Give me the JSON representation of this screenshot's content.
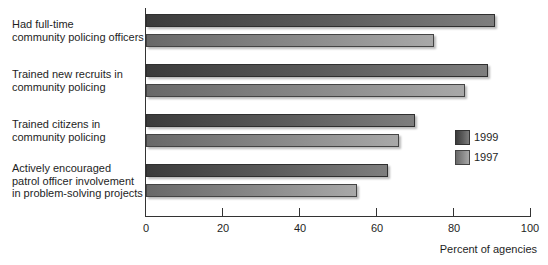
{
  "chart_data": {
    "type": "bar",
    "orientation": "horizontal",
    "title": "",
    "xlabel": "Percent of agencies",
    "ylabel": "",
    "xlim": [
      0,
      100
    ],
    "x_ticks": [
      "0",
      "20",
      "40",
      "60",
      "80",
      "100"
    ],
    "grid": false,
    "legend_position": "right",
    "categories": [
      "Had full-time\ncommunity policing officers",
      "Trained new recruits in\ncommunity policing",
      "Trained citizens in\ncommunity policing",
      "Actively encouraged\npatrol officer involvement\nin problem-solving projects"
    ],
    "series": [
      {
        "name": "1999",
        "color": "#4a4a4a",
        "values": [
          91,
          89,
          70,
          63
        ]
      },
      {
        "name": "1997",
        "color": "#8a8a8a",
        "values": [
          75,
          83,
          66,
          55
        ]
      }
    ]
  },
  "labels": {
    "cat0": "Had full-time\ncommunity policing officers",
    "cat1": "Trained new recruits in\ncommunity policing",
    "cat2": "Trained citizens in\ncommunity policing",
    "cat3": "Actively encouraged\npatrol officer involvement\nin problem-solving projects",
    "ticks": [
      "0",
      "20",
      "40",
      "60",
      "80",
      "100"
    ],
    "xlabel": "Percent of agencies",
    "legend": [
      "1999",
      "1997"
    ]
  }
}
